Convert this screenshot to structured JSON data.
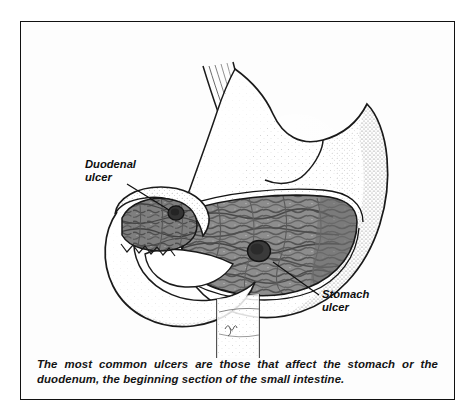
{
  "figure": {
    "caption": "The most common ulcers are those that affect the stomach or the duodenum, the beginning section of the small intestine.",
    "border_color": "#111111",
    "background_color": "#fdfdfd"
  },
  "labels": {
    "duodenal": "Duodenal\nulcer",
    "stomach": "Stomach\nulcer"
  },
  "anatomy": {
    "esophagus": "esophagus",
    "fundus": "gastric-fundus",
    "body": "gastric-body",
    "rugae": "gastric-rugae-lining",
    "pylorus": "pyloric-sphincter",
    "duodenal_bulb": "duodenal-bulb",
    "duodenal_loop": "duodenal-c-loop",
    "descending_duodenum": "descending-duodenum",
    "stomach_ulcer_spot": "stomach-ulcer-lesion",
    "duodenal_ulcer_spot": "duodenal-ulcer-lesion",
    "signature": "artist-signature"
  },
  "colors": {
    "outline": "#1a1a1a",
    "stipple": "#9a9a9a",
    "rugae_fill": "#8b8b8b",
    "rugae_dark": "#5c5c5c",
    "ulcer": "#3a3a3a",
    "lumen": "#ffffff"
  }
}
